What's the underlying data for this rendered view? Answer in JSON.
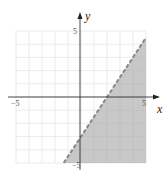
{
  "chart_data": {
    "type": "area",
    "title": "",
    "xlabel": "x",
    "ylabel": "y",
    "xlim": [
      -5,
      5
    ],
    "ylim": [
      -5,
      5
    ],
    "grid": true,
    "tick_labels": {
      "x_min": "-5",
      "x_max": "5",
      "y_min": "-5",
      "y_max": "5"
    },
    "boundary_line": {
      "equation": "y = 1.5x - 3",
      "style": "dashed",
      "points": [
        [
          -1.33,
          -5
        ],
        [
          5,
          4.5
        ]
      ]
    },
    "shaded_region": "below/right of line (y < 1.5x - 3)",
    "shade_color": "#c8c8c8",
    "line_color": "#888888"
  },
  "labels": {
    "x_axis": "x",
    "y_axis": "y",
    "x_neg": "−5",
    "x_pos": "5",
    "y_pos": "5",
    "y_neg": "−5"
  }
}
